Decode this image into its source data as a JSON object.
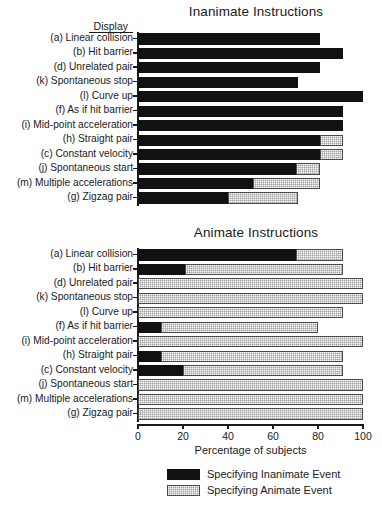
{
  "figure": {
    "display_header": "Display",
    "xaxis_title": "Percentage of subjects",
    "xticks": [
      0,
      20,
      40,
      60,
      80,
      100
    ],
    "xtick_labels": [
      "0",
      "20",
      "40",
      "60",
      "80",
      "100"
    ],
    "colors": {
      "inanimate_event": "#111111",
      "animate_event": "#c9c9c9",
      "axis": "#1a1a1a",
      "background": "#ffffff"
    },
    "legend": {
      "position": "bottom-center",
      "entries": [
        {
          "label": "Specifying Inanimate Event",
          "swatch": "black"
        },
        {
          "label": "Specifying Animate Event",
          "swatch": "gray"
        }
      ]
    }
  },
  "chart_data": [
    {
      "type": "bar",
      "orientation": "horizontal",
      "stacked": true,
      "title": "Inanimate Instructions",
      "xlabel": "Percentage of subjects",
      "ylabel": "Display",
      "xlim": [
        0,
        100
      ],
      "grid": false,
      "legend": [
        "Specifying Inanimate Event",
        "Specifying Animate Event"
      ],
      "categories": [
        "(a) Linear collision",
        "(b) Hit barrier",
        "(d) Unrelated pair",
        "(k) Spontaneous stop",
        "(l) Curve up",
        "(f) As if hit barrier",
        "(i) Mid-point acceleration",
        "(h) Straight pair",
        "(c) Constant velocity",
        "(j) Spontaneous start",
        "(m) Multiple accelerations",
        "(g) Zigzag pair"
      ],
      "series": [
        {
          "name": "Specifying Inanimate Event",
          "values": [
            81,
            91,
            81,
            71,
            100,
            91,
            91,
            81,
            81,
            70,
            51,
            40
          ]
        },
        {
          "name": "Specifying Animate Event",
          "values": [
            0,
            0,
            0,
            0,
            0,
            0,
            0,
            10,
            10,
            11,
            30,
            31
          ]
        }
      ]
    },
    {
      "type": "bar",
      "orientation": "horizontal",
      "stacked": true,
      "title": "Animate Instructions",
      "xlabel": "Percentage of subjects",
      "ylabel": "Display",
      "xlim": [
        0,
        100
      ],
      "grid": false,
      "legend": [
        "Specifying Inanimate Event",
        "Specifying Animate Event"
      ],
      "categories": [
        "(a) Linear collision",
        "(b) Hit barrier",
        "(d) Unrelated pair",
        "(k) Spontaneous stop",
        "(l) Curve up",
        "(f) As if hit barrier",
        "(i) Mid-point acceleration",
        "(h) Straight pair",
        "(c) Constant velocity",
        "(j) Spontaneous start",
        "(m) Multiple accelerations",
        "(g) Zigzag pair"
      ],
      "series": [
        {
          "name": "Specifying Inanimate Event",
          "values": [
            70,
            21,
            0,
            0,
            0,
            10,
            0,
            10,
            20,
            0,
            0,
            0
          ]
        },
        {
          "name": "Specifying Animate Event",
          "values": [
            21,
            70,
            100,
            100,
            91,
            70,
            100,
            81,
            71,
            100,
            100,
            100
          ]
        }
      ]
    }
  ]
}
